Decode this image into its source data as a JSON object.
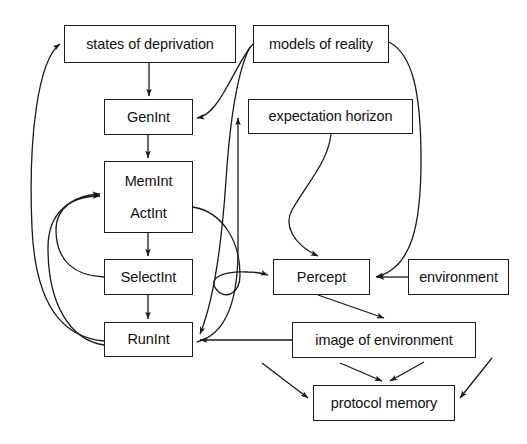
{
  "diagram": {
    "canvas": {
      "width": 527,
      "height": 444
    },
    "style": {
      "stroke": "#1a1a1a",
      "background": "#ffffff",
      "text_color": "#111111"
    },
    "nodes": [
      {
        "id": "states-of-deprivation",
        "label": "states of deprivation",
        "lines": [
          "states of deprivation"
        ],
        "x": 64,
        "y": 25,
        "w": 172,
        "h": 38
      },
      {
        "id": "models-of-reality",
        "label": "models of reality",
        "lines": [
          "models of reality"
        ],
        "x": 253,
        "y": 25,
        "w": 136,
        "h": 38
      },
      {
        "id": "genint",
        "label": "GenInt",
        "lines": [
          "GenInt"
        ],
        "x": 104,
        "y": 99,
        "w": 89,
        "h": 36
      },
      {
        "id": "expectation-horizon",
        "label": "expectation horizon",
        "lines": [
          "expectation horizon"
        ],
        "x": 248,
        "y": 99,
        "w": 165,
        "h": 35
      },
      {
        "id": "memint-actint",
        "label": "MemInt ActInt",
        "lines": [
          "MemInt",
          "ActInt"
        ],
        "x": 104,
        "y": 161,
        "w": 89,
        "h": 72
      },
      {
        "id": "selectint",
        "label": "SelectInt",
        "lines": [
          "SelectInt"
        ],
        "x": 104,
        "y": 259,
        "w": 89,
        "h": 36
      },
      {
        "id": "percept",
        "label": "Percept",
        "lines": [
          "Percept"
        ],
        "x": 273,
        "y": 259,
        "w": 97,
        "h": 36
      },
      {
        "id": "environment",
        "label": "environment",
        "lines": [
          "environment"
        ],
        "x": 408,
        "y": 259,
        "w": 101,
        "h": 36
      },
      {
        "id": "runint",
        "label": "RunInt",
        "lines": [
          "RunInt"
        ],
        "x": 104,
        "y": 322,
        "w": 89,
        "h": 35
      },
      {
        "id": "image-of-environment",
        "label": "image of environment",
        "lines": [
          "image of environment"
        ],
        "x": 292,
        "y": 322,
        "w": 184,
        "h": 36
      },
      {
        "id": "protocol-memory",
        "label": "protocol memory",
        "lines": [
          "protocol memory"
        ],
        "x": 313,
        "y": 385,
        "w": 142,
        "h": 36
      }
    ],
    "edges": [
      {
        "id": "deprivation-to-genint",
        "from": "states-of-deprivation",
        "to": "genint",
        "kind": "straight-vertical"
      },
      {
        "id": "genint-to-memint",
        "from": "genint",
        "to": "memint-actint",
        "kind": "straight-vertical"
      },
      {
        "id": "memint-to-selectint",
        "from": "memint-actint",
        "to": "selectint",
        "kind": "straight-vertical"
      },
      {
        "id": "selectint-to-runint",
        "from": "selectint",
        "to": "runint",
        "kind": "straight-vertical"
      },
      {
        "id": "models-to-genint",
        "from": "models-of-reality",
        "to": "genint",
        "kind": "curve"
      },
      {
        "id": "models-to-percept",
        "from": "models-of-reality",
        "to": "percept",
        "kind": "curve-right"
      },
      {
        "id": "models-to-runint",
        "from": "models-of-reality",
        "to": "runint",
        "kind": "curve-long"
      },
      {
        "id": "runint-to-deprivation",
        "from": "runint",
        "to": "states-of-deprivation",
        "kind": "curve-left-outer"
      },
      {
        "id": "selectint-to-memint",
        "from": "selectint",
        "to": "memint-actint",
        "kind": "curve-left-inner"
      },
      {
        "id": "runint-to-memint",
        "from": "runint",
        "to": "memint-actint",
        "kind": "curve-left-inner"
      },
      {
        "id": "runint-to-expectation",
        "from": "runint",
        "to": "expectation-horizon",
        "kind": "curve"
      },
      {
        "id": "memint-to-percept",
        "from": "memint-actint",
        "to": "percept",
        "kind": "curve"
      },
      {
        "id": "expectation-to-percept",
        "from": "expectation-horizon",
        "to": "percept",
        "kind": "curve"
      },
      {
        "id": "environment-to-percept",
        "from": "environment",
        "to": "percept",
        "kind": "straight-horizontal"
      },
      {
        "id": "percept-to-image",
        "from": "percept",
        "to": "image-of-environment",
        "kind": "diagonal"
      },
      {
        "id": "image-to-runint",
        "from": "image-of-environment",
        "to": "runint",
        "kind": "straight-horizontal"
      },
      {
        "id": "image-to-protocol-a",
        "from": "image-of-environment",
        "to": "protocol-memory",
        "kind": "diagonal"
      },
      {
        "id": "image-to-protocol-b",
        "from": "image-of-environment",
        "to": "protocol-memory",
        "kind": "diagonal"
      },
      {
        "id": "runint-to-protocol",
        "from": "runint",
        "to": "protocol-memory",
        "kind": "diagonal"
      },
      {
        "id": "environment-to-protocol",
        "from": "environment",
        "to": "protocol-memory",
        "kind": "diagonal"
      }
    ]
  }
}
